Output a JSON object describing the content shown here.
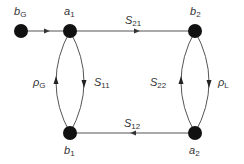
{
  "diagram": {
    "type": "signal-flow-graph",
    "colors": {
      "node": "#111111",
      "edge": "#555555",
      "text": "#333333",
      "background": "#ffffff"
    },
    "nodes": [
      {
        "id": "bG",
        "base": "b",
        "sub": "G",
        "x": 21,
        "y": 31
      },
      {
        "id": "a1",
        "base": "a",
        "sub": "1",
        "x": 70,
        "y": 31
      },
      {
        "id": "b2",
        "base": "b",
        "sub": "2",
        "x": 195,
        "y": 31
      },
      {
        "id": "b1",
        "base": "b",
        "sub": "1",
        "x": 70,
        "y": 133
      },
      {
        "id": "a2",
        "base": "a",
        "sub": "2",
        "x": 195,
        "y": 133
      }
    ],
    "edges": [
      {
        "from": "bG",
        "to": "a1",
        "base": "",
        "sub": ""
      },
      {
        "from": "a1",
        "to": "b2",
        "base": "S",
        "sub": "21"
      },
      {
        "from": "a2",
        "to": "b1",
        "base": "S",
        "sub": "12"
      },
      {
        "from": "a1",
        "to": "b1",
        "base": "S",
        "sub": "11"
      },
      {
        "from": "b1",
        "to": "a1",
        "base": "ρ",
        "sub": "G"
      },
      {
        "from": "a2",
        "to": "b2",
        "base": "S",
        "sub": "22"
      },
      {
        "from": "b2",
        "to": "a2",
        "base": "ρ",
        "sub": "L"
      }
    ]
  }
}
